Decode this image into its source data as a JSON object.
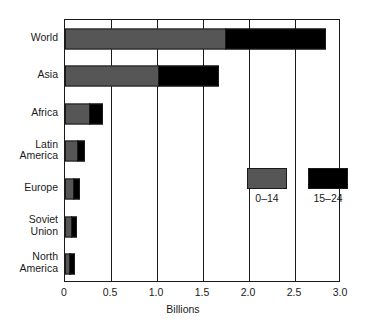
{
  "chart_data": {
    "type": "bar",
    "orientation": "horizontal",
    "stacked": true,
    "title": "",
    "xlabel": "Billions",
    "ylabel": "",
    "xlim": [
      0,
      3.0
    ],
    "xticks": [
      0,
      0.5,
      1.0,
      1.5,
      2.0,
      2.5,
      3.0
    ],
    "xtick_labels": [
      "0",
      "0.5",
      "1.0",
      "1.5",
      "2.0",
      "2.5",
      "3.0"
    ],
    "grid": true,
    "grid_axis": "x",
    "legend_position": "inside-right",
    "categories": [
      "World",
      "Asia",
      "Africa",
      "Latin\nAmerica",
      "Europe",
      "Soviet\nUnion",
      "North\nAmerica"
    ],
    "series": [
      {
        "name": "0–14",
        "color": "#565656",
        "values": [
          1.75,
          1.02,
          0.27,
          0.14,
          0.1,
          0.08,
          0.06
        ]
      },
      {
        "name": "15–24",
        "color": "#000000",
        "values": [
          1.09,
          0.65,
          0.14,
          0.08,
          0.06,
          0.05,
          0.05
        ]
      }
    ],
    "cumulative_totals": [
      2.84,
      1.67,
      0.41,
      0.22,
      0.16,
      0.13,
      0.11
    ]
  },
  "legend": {
    "entries": [
      {
        "label": "0–14",
        "color": "#565656",
        "swatch": "legend-swatch-young"
      },
      {
        "label": "15–24",
        "color": "#000000",
        "swatch": "legend-swatch-teen"
      }
    ]
  },
  "axis": {
    "x_title": "Billions",
    "tick_labels": [
      "0",
      "0.5",
      "1.0",
      "1.5",
      "2.0",
      "2.5",
      "3.0"
    ]
  },
  "categories": {
    "labels": [
      "World",
      "Asia",
      "Africa",
      "Latin\nAmerica",
      "Europe",
      "Soviet\nUnion",
      "North\nAmerica"
    ]
  },
  "colors": {
    "young": "#565656",
    "teen": "#000000",
    "axis": "#1a1a1a",
    "background": "#ffffff"
  }
}
